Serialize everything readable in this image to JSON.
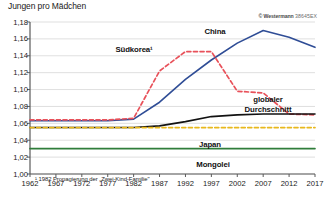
{
  "header": {
    "axis_title": "Jungen pro Mädchen",
    "credit": "© Westermann",
    "credit_code": "38645EX"
  },
  "footnote": "¹ 1982 Propagierung der „Zwei-Kind-Familie\"",
  "labels": {
    "china": "China",
    "suedkorea": "Südkorea¹",
    "global": "globaler",
    "global2": "Durchschnitt",
    "japan": "Japan",
    "mongolei": "Mongolei"
  },
  "chart_data": {
    "type": "line",
    "title": "Jungen pro Mädchen",
    "xlabel": "",
    "ylabel": "Jungen pro Mädchen",
    "xlim": [
      1962,
      2017
    ],
    "ylim": [
      1.0,
      1.18
    ],
    "ytick_labels": [
      "1,00",
      "1,02",
      "1,04",
      "1,06",
      "1,08",
      "1,10",
      "1,12",
      "1,14",
      "1,16",
      "1,18"
    ],
    "ytick_values": [
      1.0,
      1.02,
      1.04,
      1.06,
      1.08,
      1.1,
      1.12,
      1.14,
      1.16,
      1.18
    ],
    "xtick_labels": [
      "1962",
      "1967",
      "1972",
      "1977",
      "1982",
      "1987",
      "1992",
      "1997",
      "2002",
      "2007",
      "2012",
      "2017"
    ],
    "xtick_values": [
      1962,
      1967,
      1972,
      1977,
      1982,
      1987,
      1992,
      1997,
      2002,
      2007,
      2012,
      2017
    ],
    "grid": true,
    "legend": "inline-labels",
    "series": [
      {
        "name": "China",
        "color": "#2f4d96",
        "style": "solid",
        "x": [
          1962,
          1967,
          1972,
          1977,
          1982,
          1987,
          1992,
          1997,
          2002,
          2007,
          2012,
          2017
        ],
        "values": [
          1.063,
          1.063,
          1.063,
          1.063,
          1.065,
          1.085,
          1.112,
          1.135,
          1.155,
          1.17,
          1.162,
          1.15
        ]
      },
      {
        "name": "Südkorea¹",
        "color": "#e8515a",
        "style": "dashed",
        "x": [
          1962,
          1967,
          1972,
          1977,
          1982,
          1987,
          1992,
          1997,
          2002,
          2007,
          2012,
          2017
        ],
        "values": [
          1.064,
          1.064,
          1.064,
          1.064,
          1.066,
          1.122,
          1.145,
          1.145,
          1.098,
          1.096,
          1.071,
          1.07
        ]
      },
      {
        "name": "globaler Durchschnitt",
        "color": "#121212",
        "style": "solid",
        "x": [
          1962,
          1967,
          1972,
          1977,
          1982,
          1987,
          1992,
          1997,
          2002,
          2007,
          2012,
          2017
        ],
        "values": [
          1.055,
          1.055,
          1.055,
          1.055,
          1.055,
          1.057,
          1.062,
          1.068,
          1.07,
          1.071,
          1.071,
          1.071
        ]
      },
      {
        "name": "Japan",
        "color": "#e8b81d",
        "style": "dashed",
        "x": [
          1962,
          1967,
          1972,
          1977,
          1982,
          1987,
          1992,
          1997,
          2002,
          2007,
          2012,
          2017
        ],
        "values": [
          1.055,
          1.055,
          1.055,
          1.055,
          1.055,
          1.055,
          1.055,
          1.055,
          1.055,
          1.055,
          1.055,
          1.055
        ]
      },
      {
        "name": "Mongolei",
        "color": "#2f7d3a",
        "style": "solid",
        "x": [
          1962,
          1967,
          1972,
          1977,
          1982,
          1987,
          1992,
          1997,
          2002,
          2007,
          2012,
          2017
        ],
        "values": [
          1.03,
          1.03,
          1.03,
          1.03,
          1.03,
          1.03,
          1.03,
          1.03,
          1.03,
          1.03,
          1.03,
          1.03
        ]
      }
    ]
  }
}
